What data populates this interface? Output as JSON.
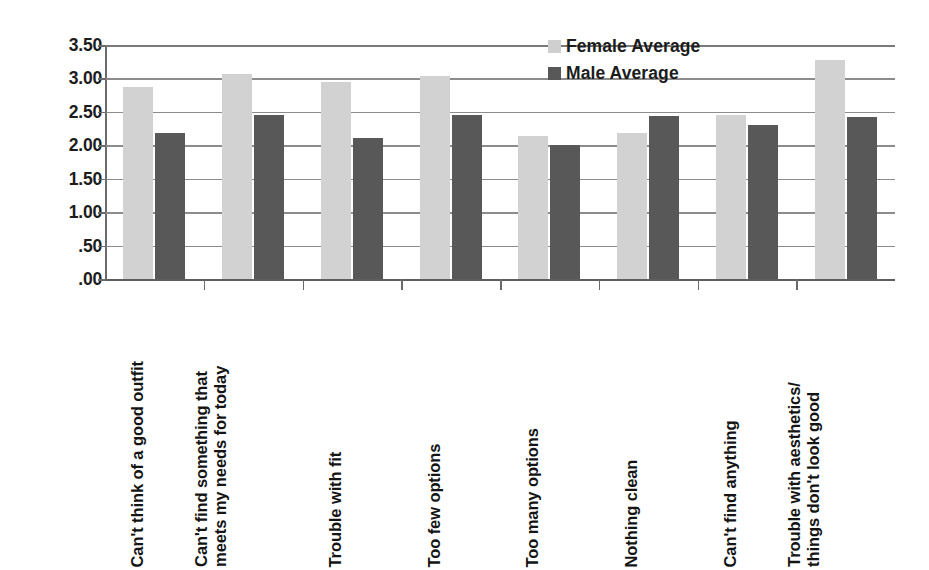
{
  "chart_data": {
    "type": "bar",
    "title": "",
    "xlabel": "",
    "ylabel": "",
    "ylim": [
      0,
      3.5
    ],
    "grid": true,
    "legend_position": "top-right",
    "ytick_labels": [
      "3.50",
      "3.00",
      "2.50",
      "2.00",
      "1.50",
      "1.00",
      ".50",
      ".00"
    ],
    "ytick_values": [
      3.5,
      3.0,
      2.5,
      2.0,
      1.5,
      1.0,
      0.5,
      0.0
    ],
    "categories": [
      "Can't think of a good outfit",
      "Can't find something that meets my needs for today",
      "Trouble with fit",
      "Too few options",
      "Too many options",
      "Nothing clean",
      "Can't find anything",
      "Trouble with aesthetics/things don't look good"
    ],
    "category_lines": [
      [
        "Can't think of a good outfit"
      ],
      [
        "Can't find something that",
        "meets my needs for today"
      ],
      [
        "Trouble with fit"
      ],
      [
        "Too few options"
      ],
      [
        "Too many options"
      ],
      [
        "Nothing clean"
      ],
      [
        "Can't find anything"
      ],
      [
        "Trouble with aesthetics/",
        "things don't look good"
      ]
    ],
    "series": [
      {
        "name": "Female Average",
        "color": "#d2d2d2",
        "values": [
          2.87,
          3.06,
          2.94,
          3.04,
          2.14,
          2.19,
          2.46,
          3.27
        ]
      },
      {
        "name": "Male Average",
        "color": "#585858",
        "values": [
          2.18,
          2.46,
          2.11,
          2.46,
          2.01,
          2.44,
          2.3,
          2.43
        ]
      }
    ]
  },
  "legend": {
    "items": [
      {
        "label": "Female Average",
        "swatch": "female"
      },
      {
        "label": "Male Average",
        "swatch": "male"
      }
    ]
  }
}
